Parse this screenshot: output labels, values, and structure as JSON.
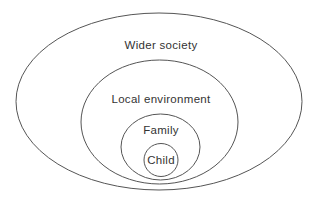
{
  "diagram": {
    "colors": {
      "background": "#ffffff",
      "stroke": "#555555",
      "text": "#333333"
    },
    "layers": [
      {
        "label": "Wider society",
        "cx": 159,
        "cy": 101.5,
        "rx": 143,
        "ry": 88.5,
        "label_x": 161,
        "label_y": 45
      },
      {
        "label": "Local environment",
        "cx": 159.5,
        "cy": 122,
        "rx": 78.5,
        "ry": 62,
        "label_x": 161,
        "label_y": 99
      },
      {
        "label": "Family",
        "cx": 160.5,
        "cy": 147,
        "rx": 39.5,
        "ry": 33,
        "label_x": 161,
        "label_y": 130
      },
      {
        "label": "Child",
        "cx": 161,
        "cy": 160,
        "rx": 17,
        "ry": 16.5,
        "label_x": 161,
        "label_y": 160
      }
    ]
  }
}
